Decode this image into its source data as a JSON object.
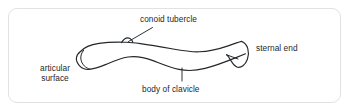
{
  "figure": {
    "name": "clavicle-anatomy-diagram",
    "subject": "clavicle",
    "frame_color": "#e2e2e2",
    "background_color": "#ffffff",
    "line_color": "#24282b",
    "text_color": "#24282b"
  },
  "labels": {
    "conoid_tubercle": "conoid tubercle",
    "sternal_end": "sternal end",
    "articular_surface_line1": "articular",
    "articular_surface_line2": "surface",
    "body_of_clavicle": "body of clavicle"
  },
  "annotations": {
    "conoid_leader_line": "leader-line",
    "body_tick_mark": "tick-mark"
  }
}
